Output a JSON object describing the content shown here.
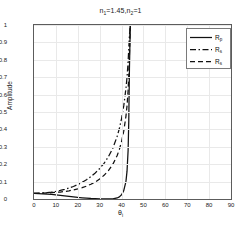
{
  "chart_data": {
    "type": "line",
    "title": "n1=1.45,n2=1",
    "title_parts": {
      "n1_base": "n",
      "n1_sub": "1",
      "n1_val": "=1.45,",
      "n2_base": "n",
      "n2_sub": "2",
      "n2_val": "=1"
    },
    "xlabel": "θi",
    "xlabel_parts": {
      "base": "θ",
      "sub": "i"
    },
    "ylabel": "Amplitude",
    "xlim": [
      0,
      90
    ],
    "ylim": [
      0,
      1
    ],
    "xticks": [
      0,
      10,
      20,
      30,
      40,
      50,
      60,
      70,
      80,
      90
    ],
    "yticks": [
      0,
      0.1,
      0.2,
      0.3,
      0.4,
      0.5,
      0.6,
      0.7,
      0.8,
      0.9,
      1
    ],
    "ytick_labels": [
      "0",
      "0.1",
      "0.2",
      "0.3",
      "0.4",
      "0.5",
      "0.6",
      "0.7",
      "0.8",
      "0.9",
      "1"
    ],
    "xtick_labels": [
      "0",
      "10",
      "20",
      "30",
      "40",
      "50",
      "60",
      "70",
      "80",
      "90"
    ],
    "grid": true,
    "grid_color": "#e9e9e9",
    "axis_color": "#5c5c5c",
    "legend_position": "top-right",
    "critical_angle": 43.6,
    "series": [
      {
        "name": "Rp",
        "name_base": "R",
        "name_sub": "p",
        "style": "solid",
        "color": "#111111",
        "x": [
          0,
          2,
          4,
          6,
          8,
          10,
          12,
          14,
          16,
          18,
          20,
          22,
          24,
          26,
          28,
          30,
          32,
          34,
          36,
          38,
          39,
          40,
          41,
          42,
          42.5,
          43,
          43.3,
          43.6,
          44,
          46,
          50,
          55,
          60,
          65,
          70,
          75,
          80,
          85,
          90
        ],
        "y": [
          0.032,
          0.031,
          0.03,
          0.028,
          0.026,
          0.024,
          0.021,
          0.018,
          0.015,
          0.012,
          0.009,
          0.007,
          0.005,
          0.003,
          0.002,
          0.001,
          0.0005,
          0.0003,
          0.0008,
          0.006,
          0.012,
          0.024,
          0.048,
          0.1,
          0.16,
          0.28,
          0.45,
          0.75,
          1.0,
          1.0,
          1.0,
          1.0,
          1.0,
          1.0,
          1.0,
          1.0,
          1.0,
          1.0,
          1.0
        ]
      },
      {
        "name": "Rs",
        "name_base": "R",
        "name_sub": "s",
        "style": "dashdot",
        "color": "#111111",
        "x": [
          0,
          2,
          4,
          6,
          8,
          10,
          12,
          14,
          16,
          18,
          20,
          22,
          24,
          26,
          28,
          30,
          32,
          34,
          36,
          38,
          39,
          40,
          41,
          42,
          42.5,
          43,
          43.3,
          43.6,
          44,
          46,
          50,
          55,
          60,
          65,
          70,
          75,
          80,
          85,
          90
        ],
        "y": [
          0.033,
          0.034,
          0.035,
          0.037,
          0.04,
          0.044,
          0.049,
          0.055,
          0.063,
          0.072,
          0.083,
          0.096,
          0.111,
          0.129,
          0.15,
          0.175,
          0.205,
          0.243,
          0.292,
          0.36,
          0.405,
          0.462,
          0.535,
          0.635,
          0.7,
          0.79,
          0.865,
          0.94,
          1.0,
          1.0,
          1.0,
          1.0,
          1.0,
          1.0,
          1.0,
          1.0,
          1.0,
          1.0,
          1.0
        ]
      },
      {
        "name": "Rs",
        "name_base": "R",
        "name_sub": "s",
        "style": "dashed",
        "color": "#111111",
        "x": [
          0,
          2,
          4,
          6,
          8,
          10,
          12,
          14,
          16,
          18,
          20,
          22,
          24,
          26,
          28,
          30,
          32,
          34,
          36,
          38,
          39,
          40,
          41,
          42,
          42.5,
          43,
          43.3,
          43.6,
          44,
          46,
          50,
          55,
          60,
          65,
          70,
          75,
          80,
          85,
          90
        ],
        "y": [
          0.033,
          0.033,
          0.034,
          0.035,
          0.036,
          0.038,
          0.04,
          0.043,
          0.047,
          0.052,
          0.058,
          0.065,
          0.074,
          0.085,
          0.098,
          0.115,
          0.136,
          0.163,
          0.199,
          0.25,
          0.285,
          0.33,
          0.39,
          0.475,
          0.535,
          0.625,
          0.715,
          0.83,
          1.0,
          1.0,
          1.0,
          1.0,
          1.0,
          1.0,
          1.0,
          1.0,
          1.0,
          1.0,
          1.0
        ]
      }
    ]
  }
}
